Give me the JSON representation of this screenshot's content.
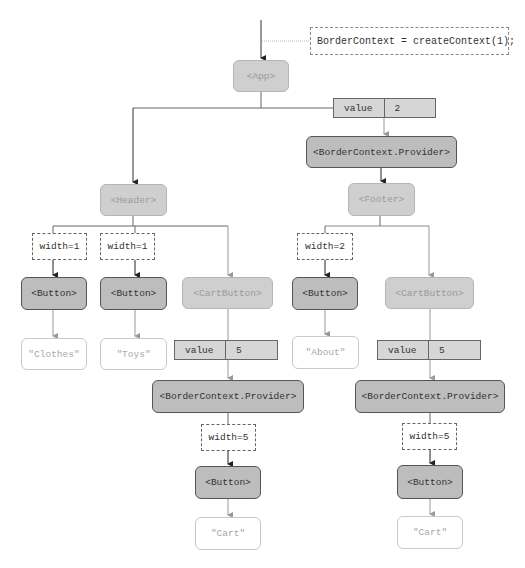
{
  "declaration": "BorderContext = createContext(1);",
  "nodes": {
    "app": "<App>",
    "provider_top": "<BorderContext.Provider>",
    "header": "<Header>",
    "footer": "<Footer>",
    "button_clothes": "<Button>",
    "button_toys": "<Button>",
    "cartbutton_left": "<CartButton>",
    "button_about": "<Button>",
    "cartbutton_right": "<CartButton>",
    "provider_left": "<BorderContext.Provider>",
    "provider_right": "<BorderContext.Provider>",
    "button_cart_left": "<Button>",
    "button_cart_right": "<Button>"
  },
  "text_nodes": {
    "clothes": "\"Clothes\"",
    "toys": "\"Toys\"",
    "about": "\"About\"",
    "cart_left": "\"Cart\"",
    "cart_right": "\"Cart\""
  },
  "props": {
    "clothes_width": "width=1",
    "toys_width": "width=1",
    "about_width": "width=2",
    "cart_left_width": "width=5",
    "cart_right_width": "width=5"
  },
  "values": {
    "top": {
      "key": "value",
      "val": "2"
    },
    "left": {
      "key": "value",
      "val": "5"
    },
    "right": {
      "key": "value",
      "val": "5"
    }
  },
  "colors": {
    "light_component": "#cfcfcf",
    "dark_component": "#bdbdbd",
    "line_dark": "#333333",
    "line_light": "#999999"
  }
}
